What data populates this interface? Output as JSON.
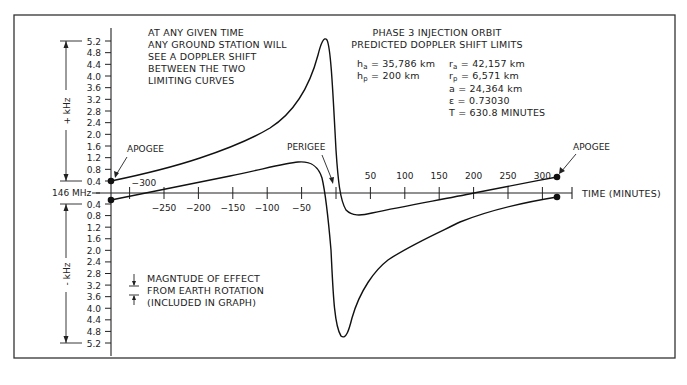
{
  "chart_data": {
    "type": "line",
    "title": "PHASE 3 INJECTION ORBIT",
    "subtitle": "PREDICTED DOPPLER SHIFT LIMITS",
    "xlabel": "TIME (MINUTES)",
    "ylabel_positive": "+ kHz",
    "ylabel_negative": "- kHz",
    "center_label": "146 MHz",
    "x_ticks": [
      -300,
      -250,
      -200,
      -150,
      -100,
      -50,
      50,
      100,
      150,
      200,
      250,
      300
    ],
    "y_ticks_positive": [
      "5.2",
      "4.8",
      "4.4",
      "4.0",
      "3.6",
      "3.2",
      "2.8",
      "2.4",
      "2.0",
      "1.6",
      "1.2",
      "0.8",
      "0.4"
    ],
    "y_ticks_negative": [
      "0.4",
      "0.8",
      "1.2",
      "1.6",
      "2.0",
      "2.4",
      "2.8",
      "3.2",
      "3.6",
      "4.0",
      "4.4",
      "4.8",
      "5.2"
    ],
    "xlim": [
      -315,
      340
    ],
    "ylim": [
      -5.6,
      5.6
    ],
    "series": [
      {
        "name": "Upper limiting curve",
        "x": [
          -315,
          -250,
          -200,
          -150,
          -100,
          -50,
          -25,
          -15,
          -8,
          0,
          10,
          20,
          40,
          100,
          150,
          200,
          250,
          315
        ],
        "y": [
          0.4,
          0.8,
          1.2,
          1.6,
          2.1,
          3.0,
          4.3,
          5.3,
          4.8,
          1.0,
          -0.6,
          -0.9,
          -1.0,
          -0.7,
          -0.3,
          0.1,
          0.4,
          0.5
        ]
      },
      {
        "name": "Lower limiting curve",
        "x": [
          -315,
          -250,
          -200,
          -150,
          -100,
          -55,
          -40,
          -25,
          -15,
          -5,
          0,
          5,
          15,
          30,
          60,
          100,
          150,
          200,
          250,
          315
        ],
        "y": [
          -0.3,
          0.0,
          0.4,
          0.7,
          1.0,
          1.3,
          1.2,
          0.6,
          -0.3,
          -2.2,
          -3.5,
          -5.3,
          -4.3,
          -2.9,
          -2.0,
          -1.4,
          -0.9,
          -0.5,
          -0.3,
          -0.2
        ]
      }
    ],
    "annotations": {
      "apogee_left": "APOGEE",
      "apogee_right": "APOGEE",
      "perigee": "PERIGEE",
      "note_lines": [
        "AT ANY GIVEN TIME",
        "ANY GROUND STATION WILL",
        "SEE A DOPPLER SHIFT",
        "BETWEEN THE TWO",
        "LIMITING CURVES"
      ],
      "legend_lines": [
        "MAGNTUDE OF EFFECT",
        "FROM EARTH ROTATION",
        "(INCLUDED IN GRAPH)"
      ]
    },
    "orbit_params": {
      "ha": {
        "sym": "h",
        "sub": "a",
        "value": " = 35,786 km"
      },
      "hp": {
        "sym": "h",
        "sub": "p",
        "value": " = 200 km"
      },
      "ra": {
        "sym": "r",
        "sub": "a",
        "value": " = 42,157 km"
      },
      "rp": {
        "sym": "r",
        "sub": "p",
        "value": " = 6,571 km"
      },
      "a": "a = 24,364 km",
      "e": "ε = 0.73030",
      "T": "T = 630.8 MINUTES"
    },
    "grid": false,
    "legend_position": "none"
  }
}
